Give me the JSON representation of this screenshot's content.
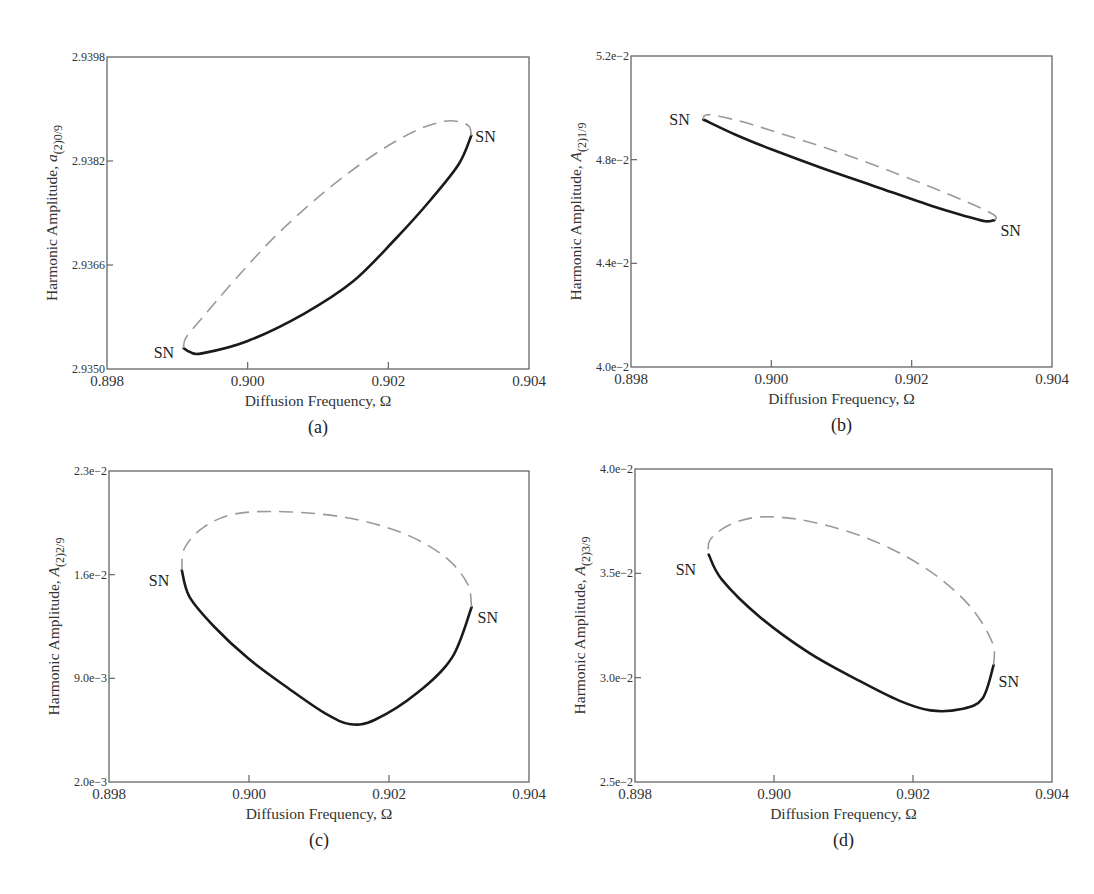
{
  "chart_data": [
    {
      "id": "a",
      "type": "line",
      "caption": "(a)",
      "xlabel": "Diffusion Frequency, Ω",
      "ylabel_prefix": "Harmonic Amplitude, ",
      "ylabel_symbol": "a",
      "ylabel_subscript": "(2)0/9",
      "xlim": [
        0.898,
        0.904
      ],
      "ylim": [
        2.935,
        2.9398
      ],
      "xticks": [
        0.898,
        0.9,
        0.902,
        0.904
      ],
      "xtick_labels": [
        "0.898",
        "0.900",
        "0.902",
        "0.904"
      ],
      "yticks": [
        2.935,
        2.9366,
        2.9382,
        2.9398
      ],
      "ytick_labels": [
        "2.9350",
        "2.9366",
        "2.9382",
        "2.9398"
      ],
      "frame_px": {
        "left": 107,
        "top": 57,
        "right": 529,
        "bottom": 369
      },
      "series": [
        {
          "name": "stable",
          "style": "solid",
          "points": [
            [
              0.89909,
              2.93532
            ],
            [
              0.89918,
              2.93526
            ],
            [
              0.89935,
              2.93524
            ],
            [
              0.9,
              2.93543
            ],
            [
              0.9008,
              2.93585
            ],
            [
              0.9015,
              2.93635
            ],
            [
              0.9021,
              2.937
            ],
            [
              0.9026,
              2.9376
            ],
            [
              0.903,
              2.93815
            ],
            [
              0.90318,
              2.93859
            ]
          ]
        },
        {
          "name": "unstable",
          "style": "dashed",
          "points": [
            [
              0.90318,
              2.93859
            ],
            [
              0.90315,
              2.93873
            ],
            [
              0.90302,
              2.9388
            ],
            [
              0.9028,
              2.93881
            ],
            [
              0.9024,
              2.93867
            ],
            [
              0.9018,
              2.9383
            ],
            [
              0.9011,
              2.93773
            ],
            [
              0.9004,
              2.93705
            ],
            [
              0.8998,
              2.93635
            ],
            [
              0.89935,
              2.93578
            ],
            [
              0.89912,
              2.93548
            ],
            [
              0.89909,
              2.93532
            ]
          ]
        }
      ],
      "annotations": [
        {
          "text": "SN",
          "x": 0.89909,
          "y": 2.93532,
          "dx": -30,
          "dy": 10
        },
        {
          "text": "SN",
          "x": 0.90318,
          "y": 2.93859,
          "dx": 4,
          "dy": 6
        }
      ]
    },
    {
      "id": "b",
      "type": "line",
      "caption": "(b)",
      "xlabel": "Diffusion Frequency, Ω",
      "ylabel_prefix": "Harmonic Amplitude, ",
      "ylabel_symbol": "A",
      "ylabel_subscript": "(2)1/9",
      "xlim": [
        0.898,
        0.904
      ],
      "ylim": [
        0.04,
        0.052
      ],
      "xticks": [
        0.898,
        0.9,
        0.902,
        0.904
      ],
      "xtick_labels": [
        "0.898",
        "0.900",
        "0.902",
        "0.904"
      ],
      "yticks": [
        0.04,
        0.044,
        0.048,
        0.052
      ],
      "ytick_labels": [
        "4.0e−2",
        "4.4e−2",
        "4.8e−2",
        "5.2e−2"
      ],
      "frame_px": {
        "left": 631,
        "top": 56,
        "right": 1052,
        "bottom": 367
      },
      "series": [
        {
          "name": "stable",
          "style": "solid",
          "points": [
            [
              0.89903,
              0.04955
            ],
            [
              0.8995,
              0.04895
            ],
            [
              0.9,
              0.0484
            ],
            [
              0.9007,
              0.0477
            ],
            [
              0.9015,
              0.04695
            ],
            [
              0.9023,
              0.0462
            ],
            [
              0.9028,
              0.0458
            ],
            [
              0.90305,
              0.04562
            ],
            [
              0.90318,
              0.04567
            ]
          ]
        },
        {
          "name": "unstable",
          "style": "dashed",
          "points": [
            [
              0.90318,
              0.04567
            ],
            [
              0.9032,
              0.0458
            ],
            [
              0.90305,
              0.04605
            ],
            [
              0.9025,
              0.0467
            ],
            [
              0.9018,
              0.04745
            ],
            [
              0.901,
              0.04825
            ],
            [
              0.9002,
              0.04895
            ],
            [
              0.8996,
              0.04945
            ],
            [
              0.89918,
              0.04972
            ],
            [
              0.89905,
              0.0497
            ],
            [
              0.89903,
              0.04955
            ]
          ]
        }
      ],
      "annotations": [
        {
          "text": "SN",
          "x": 0.89903,
          "y": 0.04955,
          "dx": -34,
          "dy": 6
        },
        {
          "text": "SN",
          "x": 0.90318,
          "y": 0.04567,
          "dx": 6,
          "dy": 16
        }
      ]
    },
    {
      "id": "c",
      "type": "line",
      "caption": "(c)",
      "xlabel": "Diffusion Frequency, Ω",
      "ylabel_prefix": "Harmonic Amplitude, ",
      "ylabel_symbol": "A",
      "ylabel_subscript": "(2)2/9",
      "xlim": [
        0.898,
        0.904
      ],
      "ylim": [
        0.002,
        0.023
      ],
      "xticks": [
        0.898,
        0.9,
        0.902,
        0.904
      ],
      "xtick_labels": [
        "0.898",
        "0.900",
        "0.902",
        "0.904"
      ],
      "yticks": [
        0.002,
        0.009,
        0.016,
        0.023
      ],
      "ytick_labels": [
        "2.0e−3",
        "9.0e−3",
        "1.6e−2",
        "2.3e−2"
      ],
      "frame_px": {
        "left": 109,
        "top": 471,
        "right": 529,
        "bottom": 782
      },
      "series": [
        {
          "name": "stable",
          "style": "solid",
          "points": [
            [
              0.89904,
              0.0163
            ],
            [
              0.89915,
              0.0145
            ],
            [
              0.8995,
              0.0125
            ],
            [
              0.9,
              0.0103
            ],
            [
              0.9006,
              0.0082
            ],
            [
              0.9011,
              0.0066
            ],
            [
              0.90145,
              0.0059
            ],
            [
              0.9018,
              0.0062
            ],
            [
              0.9024,
              0.008
            ],
            [
              0.9029,
              0.0104
            ],
            [
              0.90318,
              0.0138
            ]
          ]
        },
        {
          "name": "unstable",
          "style": "dashed",
          "points": [
            [
              0.90318,
              0.0138
            ],
            [
              0.90312,
              0.0154
            ],
            [
              0.9028,
              0.0172
            ],
            [
              0.9022,
              0.0188
            ],
            [
              0.9014,
              0.01985
            ],
            [
              0.9005,
              0.02025
            ],
            [
              0.8998,
              0.0201
            ],
            [
              0.89935,
              0.0192
            ],
            [
              0.89908,
              0.0178
            ],
            [
              0.89904,
              0.0163
            ]
          ]
        }
      ],
      "annotations": [
        {
          "text": "SN",
          "x": 0.89904,
          "y": 0.0163,
          "dx": -33,
          "dy": 16
        },
        {
          "text": "SN",
          "x": 0.90318,
          "y": 0.0138,
          "dx": 6,
          "dy": 16
        }
      ]
    },
    {
      "id": "d",
      "type": "line",
      "caption": "(d)",
      "xlabel": "Diffusion Frequency, Ω",
      "ylabel_prefix": "Harmonic Amplitude, ",
      "ylabel_symbol": "A",
      "ylabel_subscript": "(2)3/9",
      "xlim": [
        0.898,
        0.904
      ],
      "ylim": [
        0.025,
        0.04
      ],
      "xticks": [
        0.898,
        0.9,
        0.902,
        0.904
      ],
      "xtick_labels": [
        "0.898",
        "0.900",
        "0.902",
        "0.904"
      ],
      "yticks": [
        0.025,
        0.03,
        0.035,
        0.04
      ],
      "ytick_labels": [
        "2.5e−2",
        "3.0e−2",
        "3.5e−2",
        "4.0e−2"
      ],
      "frame_px": {
        "left": 635,
        "top": 469,
        "right": 1052,
        "bottom": 782
      },
      "series": [
        {
          "name": "stable",
          "style": "solid",
          "points": [
            [
              0.89906,
              0.0359
            ],
            [
              0.89925,
              0.0347
            ],
            [
              0.8998,
              0.0329
            ],
            [
              0.9005,
              0.0312
            ],
            [
              0.9012,
              0.0299
            ],
            [
              0.9018,
              0.0289
            ],
            [
              0.90225,
              0.02843
            ],
            [
              0.9027,
              0.0285
            ],
            [
              0.903,
              0.029
            ],
            [
              0.90316,
              0.0306
            ]
          ]
        },
        {
          "name": "unstable",
          "style": "dashed",
          "points": [
            [
              0.90316,
              0.0306
            ],
            [
              0.90314,
              0.0317
            ],
            [
              0.9028,
              0.0335
            ],
            [
              0.9022,
              0.0352
            ],
            [
              0.9014,
              0.0366
            ],
            [
              0.9005,
              0.0375
            ],
            [
              0.8998,
              0.0377
            ],
            [
              0.89935,
              0.0373
            ],
            [
              0.89908,
              0.0366
            ],
            [
              0.89906,
              0.0359
            ]
          ]
        }
      ],
      "annotations": [
        {
          "text": "SN",
          "x": 0.89906,
          "y": 0.0359,
          "dx": -33,
          "dy": 20
        },
        {
          "text": "SN",
          "x": 0.90316,
          "y": 0.0306,
          "dx": 5,
          "dy": 22
        }
      ]
    }
  ]
}
